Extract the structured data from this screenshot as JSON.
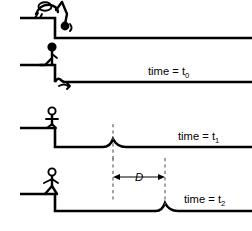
{
  "figure": {
    "width": 252,
    "height": 231,
    "line_color": "#000000",
    "dash_color": "#55565a",
    "background": "#ffffff"
  },
  "panels": [
    {
      "id": "panel-1",
      "time_label": "",
      "time_sub": "",
      "description": "person crouching at ledge edge snapping rope end downward",
      "figure_pose": "crouching-arm-down",
      "pulse": null,
      "has_dimension": false
    },
    {
      "id": "panel-2",
      "time_label": "time = t",
      "time_sub": "0",
      "description": "person kneeling at ledge, pulse just created at base of vertical rope",
      "figure_pose": "kneeling",
      "pulse": null,
      "has_dimension": false
    },
    {
      "id": "panel-3",
      "time_label": "time = t",
      "time_sub": "1",
      "description": "pulse has moved partway along the horizontal rope",
      "figure_pose": "standing",
      "pulse": {
        "x": 113,
        "marker": "dashed-line"
      },
      "has_dimension": false
    },
    {
      "id": "panel-4",
      "time_label": "time = t",
      "time_sub": "2",
      "description": "pulse has moved farther right; distance D measured between the two pulse positions",
      "figure_pose": "standing",
      "pulse": {
        "x": 165,
        "marker": "dashed-line"
      },
      "has_dimension": true
    }
  ],
  "annotations": {
    "distance_label": "D",
    "distance_from_x": 113,
    "distance_to_x": 165
  }
}
